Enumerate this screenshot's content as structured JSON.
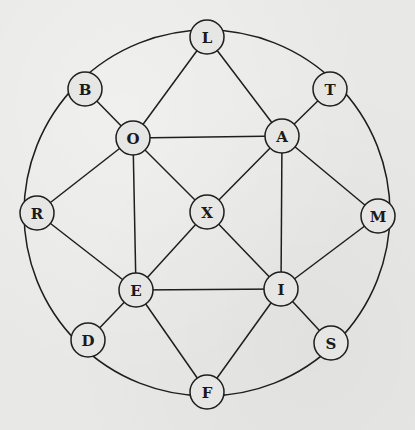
{
  "diagram": {
    "type": "graph",
    "outer_circle": {
      "cx": 207,
      "cy": 213,
      "r": 183
    },
    "node_radius": 17,
    "colors": {
      "background": "#e8e8e6",
      "stroke": "#1e1e1e",
      "node_fill": "#e6e6e4",
      "label": "#1a1a1a"
    },
    "nodes": [
      {
        "id": "L",
        "label": "L",
        "x": 207,
        "y": 37
      },
      {
        "id": "B",
        "label": "B",
        "x": 85,
        "y": 89
      },
      {
        "id": "T",
        "label": "T",
        "x": 330,
        "y": 89
      },
      {
        "id": "O",
        "label": "O",
        "x": 133,
        "y": 138
      },
      {
        "id": "A",
        "label": "A",
        "x": 282,
        "y": 136
      },
      {
        "id": "R",
        "label": "R",
        "x": 37,
        "y": 213
      },
      {
        "id": "X",
        "label": "X",
        "x": 207,
        "y": 212
      },
      {
        "id": "M",
        "label": "M",
        "x": 378,
        "y": 216
      },
      {
        "id": "E",
        "label": "E",
        "x": 136,
        "y": 290
      },
      {
        "id": "I",
        "label": "I",
        "x": 281,
        "y": 289
      },
      {
        "id": "D",
        "label": "D",
        "x": 88,
        "y": 340
      },
      {
        "id": "S",
        "label": "S",
        "x": 331,
        "y": 343
      },
      {
        "id": "F",
        "label": "F",
        "x": 207,
        "y": 392
      }
    ],
    "rim_order": [
      "L",
      "T",
      "M",
      "S",
      "F",
      "D",
      "R",
      "B"
    ],
    "edges": [
      [
        "L",
        "O"
      ],
      [
        "L",
        "A"
      ],
      [
        "B",
        "O"
      ],
      [
        "T",
        "A"
      ],
      [
        "O",
        "A"
      ],
      [
        "O",
        "R"
      ],
      [
        "O",
        "X"
      ],
      [
        "O",
        "E"
      ],
      [
        "A",
        "X"
      ],
      [
        "A",
        "M"
      ],
      [
        "A",
        "I"
      ],
      [
        "R",
        "E"
      ],
      [
        "X",
        "E"
      ],
      [
        "X",
        "I"
      ],
      [
        "M",
        "I"
      ],
      [
        "E",
        "I"
      ],
      [
        "E",
        "D"
      ],
      [
        "E",
        "F"
      ],
      [
        "I",
        "S"
      ],
      [
        "I",
        "F"
      ]
    ]
  }
}
